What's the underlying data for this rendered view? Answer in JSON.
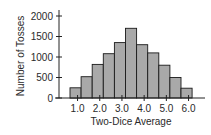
{
  "chart_data": {
    "type": "bar",
    "title": "",
    "xlabel": "Two-Dice Average",
    "ylabel": "Number of Tosses",
    "categories": [
      "1.0",
      "1.5",
      "2.0",
      "2.5",
      "3.0",
      "3.5",
      "4.0",
      "4.5",
      "5.0",
      "5.5",
      "6.0"
    ],
    "values": [
      250,
      520,
      820,
      1080,
      1350,
      1700,
      1300,
      1100,
      800,
      500,
      240
    ],
    "x_tick_labels": [
      "1.0",
      "2.0",
      "3.0",
      "4.0",
      "5.0",
      "6.0"
    ],
    "y_tick_labels": [
      "0",
      "500",
      "1000",
      "1500",
      "2000"
    ],
    "ylim": [
      0,
      2000
    ],
    "grid": false,
    "legend": null,
    "bar_color": "#a9a9a9",
    "bar_edge_color": "#1a1a1a"
  }
}
